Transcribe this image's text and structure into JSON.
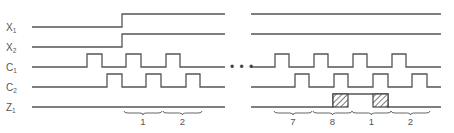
{
  "diagram": {
    "signals": [
      {
        "name": "X",
        "sub": "1",
        "low_y": 27,
        "high_y": 14
      },
      {
        "name": "X",
        "sub": "2",
        "low_y": 47,
        "high_y": 34
      },
      {
        "name": "C",
        "sub": "1",
        "low_y": 67,
        "high_y": 54
      },
      {
        "name": "C",
        "sub": "2",
        "low_y": 87,
        "high_y": 74
      },
      {
        "name": "Z",
        "sub": "1",
        "low_y": 107,
        "high_y": 94
      }
    ],
    "sections": [
      {
        "x_start": 32,
        "x_end": 225,
        "waves": {
          "X1": {
            "initial": "low",
            "edges": [
              122
            ]
          },
          "X2": {
            "initial": "low",
            "edges": [
              122
            ]
          },
          "C1": {
            "initial": "low",
            "pulses": [
              [
                87,
                102
              ],
              [
                126,
                141
              ],
              [
                166,
                180
              ]
            ]
          },
          "C2": {
            "initial": "low",
            "pulses": [
              [
                107,
                122
              ],
              [
                146,
                161
              ],
              [
                186,
                200
              ]
            ]
          },
          "Z1": {
            "initial": "low",
            "pulses": []
          }
        },
        "braces": [
          {
            "x1": 124,
            "x2": 162,
            "label": "1"
          },
          {
            "x1": 163,
            "x2": 202,
            "label": "2"
          }
        ]
      },
      {
        "x_start": 251,
        "x_end": 441,
        "waves": {
          "X1": {
            "initial": "high",
            "edges": []
          },
          "X2": {
            "initial": "high",
            "edges": []
          },
          "C1": {
            "initial": "low",
            "pulses": [
              [
                275,
                289
              ],
              [
                314,
                328
              ],
              [
                353,
                367
              ],
              [
                392,
                406
              ]
            ]
          },
          "C2": {
            "initial": "low",
            "pulses": [
              [
                295,
                309
              ],
              [
                334,
                348
              ],
              [
                373,
                388
              ],
              [
                412,
                427
              ]
            ]
          },
          "Z1": {
            "initial": "low",
            "pulses": [
              [
                333,
                388
              ]
            ],
            "hatched": [
              [
                333,
                348
              ],
              [
                373,
                388
              ]
            ]
          }
        },
        "braces": [
          {
            "x1": 274,
            "x2": 312,
            "label": "7"
          },
          {
            "x1": 313,
            "x2": 352,
            "label": "8"
          },
          {
            "x1": 352,
            "x2": 391,
            "label": "1"
          },
          {
            "x1": 391,
            "x2": 430,
            "label": "2"
          }
        ]
      }
    ],
    "ellipsis": {
      "text": "• • •",
      "x": 230,
      "y": 71
    },
    "label_x": 6,
    "brace_y": 111,
    "brace_label_y": 125,
    "colors": {
      "line": "#555555",
      "hatch": "#444444",
      "background": "#ffffff"
    }
  }
}
